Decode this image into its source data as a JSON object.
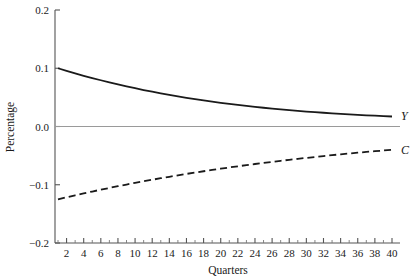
{
  "chart_data": {
    "type": "line",
    "title": "",
    "xlabel": "Quarters",
    "ylabel": "Percentage",
    "xlim": [
      1,
      40
    ],
    "ylim": [
      -0.2,
      0.2
    ],
    "grid": false,
    "legend_position": "inline-right",
    "zero_line": true,
    "zero_line_color": "#9a9a9a",
    "x_tick_labels": [
      "2",
      "4",
      "6",
      "8",
      "10",
      "12",
      "14",
      "16",
      "18",
      "20",
      "22",
      "24",
      "26",
      "28",
      "30",
      "32",
      "34",
      "36",
      "38",
      "40"
    ],
    "x_tick_values": [
      2,
      4,
      6,
      8,
      10,
      12,
      14,
      16,
      18,
      20,
      22,
      24,
      26,
      28,
      30,
      32,
      34,
      36,
      38,
      40
    ],
    "x_minor_tick_values": [
      1,
      3,
      5,
      7,
      9,
      11,
      13,
      15,
      17,
      19,
      21,
      23,
      25,
      27,
      29,
      31,
      33,
      35,
      37,
      39
    ],
    "y_tick_labels": [
      "0.2",
      "0.1",
      "0.0",
      "−0.1",
      "−0.2"
    ],
    "y_tick_values": [
      0.2,
      0.1,
      0.0,
      -0.1,
      -0.2
    ],
    "x": [
      1,
      2,
      3,
      4,
      5,
      6,
      7,
      8,
      9,
      10,
      11,
      12,
      13,
      14,
      15,
      16,
      17,
      18,
      19,
      20,
      21,
      22,
      23,
      24,
      25,
      26,
      27,
      28,
      29,
      30,
      31,
      32,
      33,
      34,
      35,
      36,
      37,
      38,
      39,
      40
    ],
    "series": [
      {
        "name": "Y",
        "label": "Y",
        "style": "solid",
        "color": "#1a1a1a",
        "width": 1.8,
        "values": [
          0.1,
          0.0955,
          0.0912,
          0.0871,
          0.0832,
          0.0794,
          0.0757,
          0.0722,
          0.0689,
          0.0657,
          0.0626,
          0.0597,
          0.0569,
          0.0542,
          0.0517,
          0.0493,
          0.047,
          0.0448,
          0.0427,
          0.0407,
          0.0388,
          0.037,
          0.0353,
          0.0337,
          0.0322,
          0.0308,
          0.0294,
          0.0281,
          0.0269,
          0.0257,
          0.0246,
          0.0236,
          0.0226,
          0.0217,
          0.0208,
          0.02,
          0.0192,
          0.0185,
          0.0178,
          0.0172
        ]
      },
      {
        "name": "C",
        "label": "C",
        "style": "dashed",
        "color": "#1a1a1a",
        "width": 1.8,
        "dash_pattern": "7,4",
        "values": [
          -0.125,
          -0.1215,
          -0.1181,
          -0.1148,
          -0.1116,
          -0.1085,
          -0.1055,
          -0.1025,
          -0.0996,
          -0.0968,
          -0.0941,
          -0.0914,
          -0.0888,
          -0.0863,
          -0.0838,
          -0.0814,
          -0.0791,
          -0.0768,
          -0.0746,
          -0.0724,
          -0.0703,
          -0.0683,
          -0.0663,
          -0.0644,
          -0.0625,
          -0.0607,
          -0.0589,
          -0.0572,
          -0.0555,
          -0.0539,
          -0.0523,
          -0.0507,
          -0.0492,
          -0.0478,
          -0.0464,
          -0.045,
          -0.0437,
          -0.0424,
          -0.0412,
          -0.04
        ]
      }
    ]
  },
  "axis_titles": {
    "x": "Quarters",
    "y": "Percentage"
  }
}
